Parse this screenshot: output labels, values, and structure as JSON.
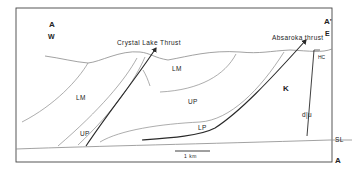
{
  "section": {
    "start_label": "A",
    "end_label": "A'",
    "start_direction": "W",
    "end_direction": "E",
    "bottom_right_label": "A"
  },
  "faults": {
    "crystal_lake": "Crystal Lake Thrust",
    "absaroka": "Absaroka thrust",
    "normal_fault_label": "d|u"
  },
  "units": {
    "lm_left": "LM",
    "lm_center": "LM",
    "up_left": "UP",
    "up_center": "UP",
    "lp": "LP",
    "k": "K",
    "hc": "HC"
  },
  "reference_line": {
    "label": "SL"
  },
  "scale_bar": {
    "label": "1 km"
  },
  "colors": {
    "frame": "#444444",
    "thin_line": "#8a8a8a",
    "fault_line": "#2a2a2a",
    "text": "#222222"
  }
}
